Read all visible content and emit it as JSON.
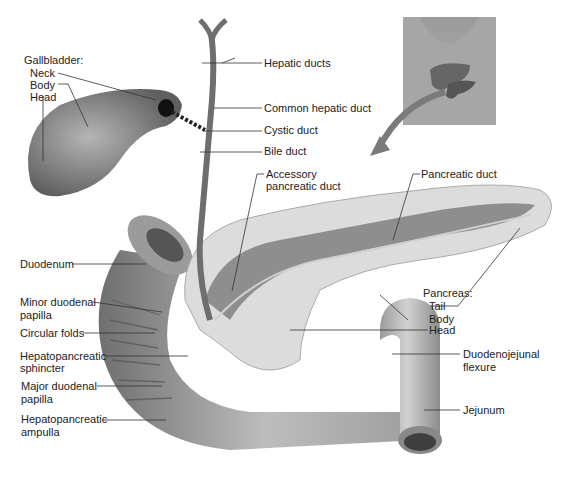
{
  "diagram": {
    "labels": {
      "gallbladder_heading": "Gallbladder:",
      "gallbladder_neck": "Neck",
      "gallbladder_body": "Body",
      "gallbladder_head": "Head",
      "hepatic_ducts": "Hepatic ducts",
      "common_hepatic_duct": "Common hepatic duct",
      "cystic_duct": "Cystic duct",
      "bile_duct": "Bile duct",
      "accessory_pancreatic_duct_1": "Accessory",
      "accessory_pancreatic_duct_2": "pancreatic duct",
      "pancreatic_duct": "Pancreatic duct",
      "duodenum": "Duodenum",
      "minor_duodenal_papilla_1": "Minor duodenal",
      "minor_duodenal_papilla_2": "papilla",
      "circular_folds": "Circular folds",
      "hepatopancreatic_sphincter_1": "Hepatopancreatic",
      "hepatopancreatic_sphincter_2": "sphincter",
      "major_duodenal_papilla_1": "Major duodenal",
      "major_duodenal_papilla_2": "papilla",
      "hepatopancreatic_ampulla_1": "Hepatopancreatic",
      "hepatopancreatic_ampulla_2": "ampulla",
      "pancreas_heading": "Pancreas:",
      "pancreas_tail": "Tail",
      "pancreas_body": "Body",
      "pancreas_head": "Head",
      "duodenojejunal_flexure_1": "Duodenojejunal",
      "duodenojejunal_flexure_2": "flexure",
      "jejunum": "Jejunum"
    },
    "colors": {
      "organ_gray": "#8a8a8a",
      "organ_light": "#c8c8c8",
      "pancreas_lobule": "#dcdcdc",
      "leader_line": "#333333",
      "arrow": "#7a7a7a"
    }
  }
}
